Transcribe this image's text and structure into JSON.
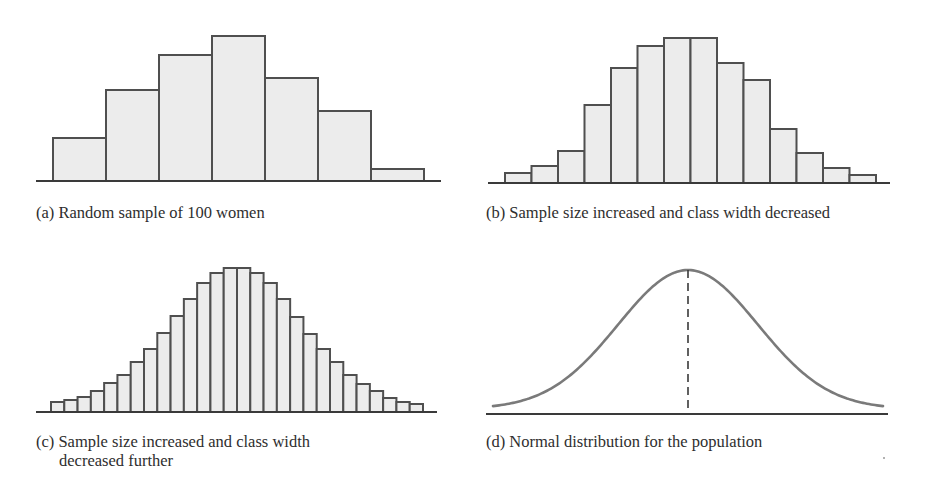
{
  "figure": {
    "style": {
      "bar_fill": "#ececec",
      "bar_stroke": "#4f4f4f",
      "axis_color": "#3a3a3a",
      "curve_color": "#7a7a7a",
      "dash_color": "#3a3a3a"
    },
    "panels": [
      {
        "id": "a",
        "caption": "(a) Random sample of 100 women",
        "caption_lines": [
          "(a) Random sample of 100 women"
        ]
      },
      {
        "id": "b",
        "caption": "(b) Sample size increased and class width decreased",
        "caption_lines": [
          "(b) Sample size increased and class width decreased"
        ]
      },
      {
        "id": "c",
        "caption": "(c) Sample size increased and class width decreased further",
        "caption_lines": [
          "(c) Sample size increased and class width",
          "decreased further"
        ]
      },
      {
        "id": "d",
        "caption": "(d) Normal distribution for the population",
        "caption_lines": [
          "(d) Normal distribution for the population"
        ]
      }
    ]
  },
  "chart_data": [
    {
      "type": "bar",
      "panel": "a",
      "title": "(a) Random sample of 100 women",
      "xlabel": "",
      "ylabel": "",
      "grid": false,
      "legend": null,
      "categories": [
        "1",
        "2",
        "3",
        "4",
        "5",
        "6",
        "7"
      ],
      "values": [
        43,
        91,
        126,
        145,
        103,
        70,
        12
      ],
      "units": "relative bar height (px above baseline)",
      "ylim": [
        0,
        150
      ]
    },
    {
      "type": "bar",
      "panel": "b",
      "title": "(b) Sample size increased and class width decreased",
      "xlabel": "",
      "ylabel": "",
      "grid": false,
      "legend": null,
      "categories": [
        "1",
        "2",
        "3",
        "4",
        "5",
        "6",
        "7",
        "8",
        "9",
        "10",
        "11",
        "12",
        "13",
        "14"
      ],
      "values": [
        10,
        17,
        32,
        78,
        115,
        137,
        145,
        145,
        120,
        103,
        54,
        30,
        15,
        8
      ],
      "units": "relative bar height (px above baseline)",
      "ylim": [
        0,
        150
      ]
    },
    {
      "type": "bar",
      "panel": "c",
      "title": "(c) Sample size increased and class width decreased further",
      "xlabel": "",
      "ylabel": "",
      "grid": false,
      "legend": null,
      "categories": [
        "1",
        "2",
        "3",
        "4",
        "5",
        "6",
        "7",
        "8",
        "9",
        "10",
        "11",
        "12",
        "13",
        "14",
        "15",
        "16",
        "17",
        "18",
        "19",
        "20",
        "21",
        "22",
        "23",
        "24",
        "25",
        "26",
        "27",
        "28"
      ],
      "values": [
        10,
        12,
        15,
        21,
        29,
        37,
        50,
        63,
        79,
        96,
        113,
        129,
        139,
        144,
        144,
        139,
        129,
        113,
        95,
        78,
        63,
        50,
        37,
        28,
        21,
        14,
        10,
        8
      ],
      "units": "relative bar height (px above baseline)",
      "ylim": [
        0,
        150
      ]
    },
    {
      "type": "line",
      "panel": "d",
      "title": "(d) Normal distribution for the population",
      "xlabel": "",
      "ylabel": "",
      "grid": false,
      "legend": null,
      "description": "Bell-shaped normal density curve with a dashed vertical line at the mean",
      "mean_marker": "dashed vertical line at peak",
      "x": [
        -2.8,
        -2.4,
        -2.0,
        -1.6,
        -1.2,
        -0.8,
        -0.4,
        0,
        0.4,
        0.8,
        1.2,
        1.6,
        2.0,
        2.4,
        2.8
      ],
      "y": [
        0.008,
        0.022,
        0.054,
        0.111,
        0.194,
        0.29,
        0.368,
        0.399,
        0.368,
        0.29,
        0.194,
        0.111,
        0.054,
        0.022,
        0.008
      ]
    }
  ]
}
